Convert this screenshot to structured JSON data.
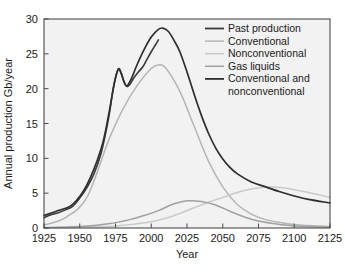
{
  "chart_data": {
    "type": "line",
    "title": "",
    "xlabel": "Year",
    "ylabel": "Annual production Gb/year",
    "xlim": [
      1925,
      2125
    ],
    "ylim": [
      0,
      30
    ],
    "xticks": [
      1925,
      1950,
      1975,
      2000,
      2025,
      2050,
      2075,
      2100,
      2125
    ],
    "xtick_labels": [
      "1925",
      "1950",
      "1975",
      "2000",
      "2025",
      "2050",
      "2075",
      "2100",
      "2125"
    ],
    "yticks": [
      0,
      5,
      10,
      15,
      20,
      25,
      30
    ],
    "ytick_labels": [
      "0",
      "5",
      "10",
      "15",
      "20",
      "25",
      "30"
    ],
    "grid": false,
    "legend_position": "top-right",
    "plot_background": "#f2f2f2",
    "frame_color": "#4a4a4a",
    "series": [
      {
        "name": "Past production",
        "color": "#3a3a3a",
        "width": 1.6,
        "x": [
          1925,
          1930,
          1935,
          1940,
          1945,
          1950,
          1955,
          1960,
          1965,
          1970,
          1973,
          1975,
          1977,
          1979,
          1981,
          1983,
          1985,
          1988,
          1991,
          1994,
          1997,
          2000,
          2003,
          2005
        ],
        "values": [
          1.5,
          1.9,
          2.2,
          2.6,
          3.1,
          4.3,
          5.8,
          7.8,
          10.8,
          15.6,
          19.5,
          21.6,
          22.8,
          22.2,
          20.9,
          20.3,
          20.6,
          21.6,
          22.4,
          23.1,
          24.2,
          25.3,
          26.3,
          27.0
        ]
      },
      {
        "name": "Conventional",
        "color": "#b5b5b5",
        "width": 1.5,
        "x": [
          1925,
          1940,
          1955,
          1970,
          1980,
          1990,
          2000,
          2005,
          2010,
          2020,
          2030,
          2040,
          2050,
          2060,
          2070,
          2080,
          2090,
          2100,
          2110,
          2125
        ],
        "values": [
          0.4,
          1.5,
          4.4,
          12.5,
          17.0,
          20.4,
          22.9,
          23.4,
          23.0,
          19.6,
          14.6,
          9.6,
          5.9,
          3.4,
          2.0,
          1.2,
          0.8,
          0.5,
          0.35,
          0.2
        ]
      },
      {
        "name": "Nonconventional",
        "color": "#c9c9c9",
        "width": 1.5,
        "x": [
          1925,
          1950,
          1975,
          1990,
          2000,
          2010,
          2020,
          2030,
          2040,
          2050,
          2060,
          2070,
          2080,
          2090,
          2100,
          2110,
          2125
        ],
        "values": [
          0.05,
          0.1,
          0.3,
          0.6,
          0.9,
          1.4,
          2.1,
          2.9,
          3.7,
          4.4,
          5.1,
          5.6,
          5.9,
          5.8,
          5.5,
          5.1,
          4.4
        ]
      },
      {
        "name": "Gas liquids",
        "color": "#a0a0a0",
        "width": 1.5,
        "x": [
          1925,
          1950,
          1970,
          1985,
          1995,
          2005,
          2015,
          2025,
          2035,
          2045,
          2055,
          2065,
          2075,
          2090,
          2100,
          2125
        ],
        "values": [
          0.05,
          0.2,
          0.6,
          1.2,
          1.8,
          2.5,
          3.4,
          3.9,
          3.8,
          3.3,
          2.4,
          1.6,
          1.0,
          0.5,
          0.3,
          0.1
        ]
      },
      {
        "name": "Conventional and nonconventional",
        "color": "#2e2e2e",
        "width": 1.7,
        "x": [
          1925,
          1935,
          1945,
          1955,
          1965,
          1970,
          1974,
          1977,
          1979,
          1981,
          1983,
          1986,
          1990,
          1995,
          2000,
          2005,
          2008,
          2012,
          2016,
          2020,
          2025,
          2030,
          2035,
          2040,
          2045,
          2050,
          2055,
          2060,
          2070,
          2080,
          2090,
          2100,
          2110,
          2125
        ],
        "values": [
          1.8,
          2.5,
          3.4,
          6.2,
          11.4,
          16.0,
          20.6,
          22.8,
          22.2,
          21.0,
          20.4,
          21.4,
          23.4,
          25.6,
          27.4,
          28.5,
          28.7,
          28.2,
          26.9,
          25.3,
          22.4,
          19.2,
          16.2,
          13.6,
          11.5,
          9.9,
          8.7,
          7.8,
          6.6,
          5.9,
          5.2,
          4.6,
          4.1,
          3.6
        ]
      }
    ],
    "legend_entries": [
      {
        "label": "Past production",
        "color": "#3a3a3a",
        "width": 1.8
      },
      {
        "label": "Conventional",
        "color": "#b5b5b5",
        "width": 1.5
      },
      {
        "label": "Nonconventional",
        "color": "#c9c9c9",
        "width": 1.5
      },
      {
        "label": "Gas liquids",
        "color": "#a0a0a0",
        "width": 1.5
      },
      {
        "label": "Conventional and",
        "color": "#2e2e2e",
        "width": 1.8
      },
      {
        "label": "nonconventional",
        "color": null,
        "width": 0
      }
    ]
  }
}
